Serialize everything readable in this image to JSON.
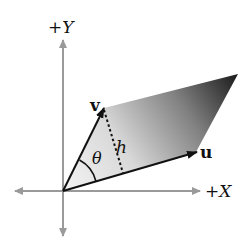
{
  "diagram": {
    "axes": {
      "x_label": "+X",
      "y_label": "+Y",
      "color": "#9a9a9a"
    },
    "vectors": {
      "u_label": "u",
      "v_label": "v",
      "color": "#111111"
    },
    "height_label": "h",
    "angle_label": "θ",
    "fill_gradient": {
      "start": "#f2f2f2",
      "end": "#1a1a1a"
    }
  }
}
